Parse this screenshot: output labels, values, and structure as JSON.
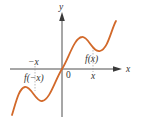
{
  "diagram": {
    "kind": "odd-function graph",
    "colors": {
      "curve": "#D2692A",
      "axis": "#3a3a3a",
      "dashed_guide": "#8a8a8a",
      "text": "#333333"
    },
    "axes": {
      "x_label": "x",
      "y_label": "y",
      "origin_label": "0"
    },
    "labels": {
      "neg_x": "−x",
      "pos_x": "x",
      "f_neg_x": "f(−x)",
      "f_x": "f(x)"
    },
    "curve": {
      "description": "odd function symmetric about origin: local max right of origin, local min left of origin"
    }
  }
}
